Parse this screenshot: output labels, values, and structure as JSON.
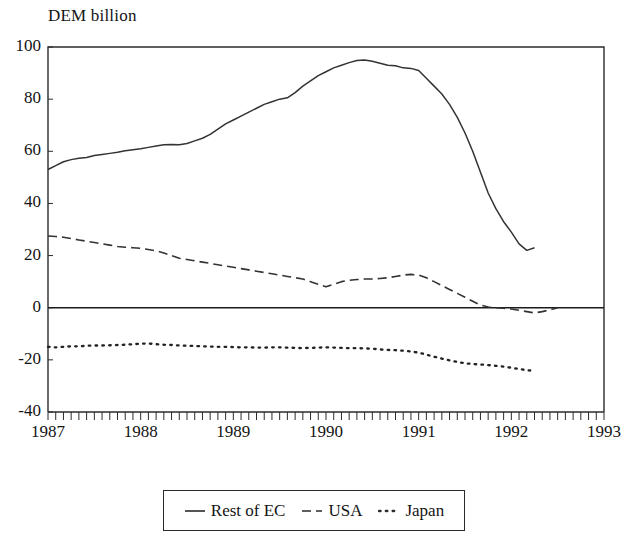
{
  "chart_data": {
    "type": "line",
    "title": "DEM billion",
    "xlabel": "",
    "ylabel": "DEM billion",
    "xlim": [
      1987.0,
      1993.0
    ],
    "ylim": [
      -40,
      100
    ],
    "ytick_labels": [
      "100",
      "80",
      "60",
      "40",
      "20",
      "0",
      "-20",
      "-40"
    ],
    "yticks": [
      100,
      80,
      60,
      40,
      20,
      0,
      -20,
      -40
    ],
    "xtick_labels": [
      "1987",
      "1988",
      "1989",
      "1990",
      "1991",
      "1992",
      "1993"
    ],
    "xticks": [
      1987,
      1988,
      1989,
      1990,
      1991,
      1992,
      1993
    ],
    "minor_xticks_per_year": 12,
    "grid": false,
    "zero_line": true,
    "legend_position": "below-center",
    "series": [
      {
        "name": "Rest of EC",
        "style": "solid",
        "color": "#333333",
        "x": [
          1987.0,
          1987.083,
          1987.167,
          1987.25,
          1987.333,
          1987.417,
          1987.5,
          1987.583,
          1987.667,
          1987.75,
          1987.833,
          1987.917,
          1988.0,
          1988.083,
          1988.167,
          1988.25,
          1988.333,
          1988.417,
          1988.5,
          1988.583,
          1988.667,
          1988.75,
          1988.833,
          1988.917,
          1989.0,
          1989.083,
          1989.167,
          1989.25,
          1989.333,
          1989.417,
          1989.5,
          1989.583,
          1989.667,
          1989.75,
          1989.833,
          1989.917,
          1990.0,
          1990.083,
          1990.167,
          1990.25,
          1990.333,
          1990.417,
          1990.5,
          1990.583,
          1990.667,
          1990.75,
          1990.833,
          1990.917,
          1991.0,
          1991.083,
          1991.167,
          1991.25,
          1991.333,
          1991.417,
          1991.5,
          1991.583,
          1991.667,
          1991.75,
          1991.833,
          1991.917,
          1992.0,
          1992.083,
          1992.167,
          1992.25
        ],
        "values": [
          53.0,
          54.5,
          56.0,
          56.8,
          57.3,
          57.6,
          58.4,
          58.8,
          59.2,
          59.6,
          60.2,
          60.6,
          61.0,
          61.5,
          62.0,
          62.5,
          62.6,
          62.5,
          63.0,
          64.0,
          65.0,
          66.5,
          68.5,
          70.5,
          72.0,
          73.5,
          75.0,
          76.5,
          78.0,
          79.0,
          80.0,
          80.5,
          82.5,
          85.0,
          87.0,
          89.0,
          90.5,
          92.0,
          93.0,
          94.0,
          94.8,
          95.0,
          94.5,
          93.8,
          93.0,
          92.8,
          92.0,
          91.8,
          91.0,
          88.0,
          85.0,
          82.0,
          78.0,
          73.0,
          67.0,
          60.0,
          52.0,
          44.0,
          38.0,
          33.0,
          29.0,
          24.5,
          22.0,
          23.0
        ]
      },
      {
        "name": "USA",
        "style": "dashed",
        "color": "#333333",
        "x": [
          1987.0,
          1987.083,
          1987.167,
          1987.25,
          1987.333,
          1987.417,
          1987.5,
          1987.583,
          1987.667,
          1987.75,
          1987.833,
          1987.917,
          1988.0,
          1988.083,
          1988.167,
          1988.25,
          1988.333,
          1988.417,
          1988.5,
          1988.583,
          1988.667,
          1988.75,
          1988.833,
          1988.917,
          1989.0,
          1989.083,
          1989.167,
          1989.25,
          1989.333,
          1989.417,
          1989.5,
          1989.583,
          1989.667,
          1989.75,
          1989.833,
          1989.917,
          1990.0,
          1990.083,
          1990.167,
          1990.25,
          1990.333,
          1990.417,
          1990.5,
          1990.583,
          1990.667,
          1990.75,
          1990.833,
          1990.917,
          1991.0,
          1991.083,
          1991.167,
          1991.25,
          1991.333,
          1991.417,
          1991.5,
          1991.583,
          1991.667,
          1991.75,
          1991.833,
          1991.917,
          1992.0,
          1992.083,
          1992.167,
          1992.25,
          1992.333,
          1992.417,
          1992.5
        ],
        "values": [
          27.5,
          27.3,
          27.0,
          26.5,
          26.0,
          25.5,
          25.0,
          24.5,
          24.0,
          23.5,
          23.2,
          23.0,
          22.8,
          22.3,
          21.8,
          21.0,
          20.0,
          19.0,
          18.5,
          18.0,
          17.5,
          17.0,
          16.5,
          16.0,
          15.5,
          15.0,
          14.5,
          14.0,
          13.5,
          13.0,
          12.5,
          12.0,
          11.5,
          11.0,
          10.0,
          9.0,
          8.0,
          9.0,
          10.0,
          10.5,
          10.8,
          11.0,
          11.0,
          11.2,
          11.5,
          12.0,
          12.5,
          12.8,
          12.5,
          11.5,
          10.0,
          8.5,
          7.0,
          5.5,
          4.0,
          2.5,
          1.0,
          0.3,
          0.0,
          -0.2,
          -0.5,
          -1.0,
          -1.5,
          -2.0,
          -1.5,
          -0.8,
          0.0
        ]
      },
      {
        "name": "Japan",
        "style": "dotted",
        "color": "#222222",
        "x": [
          1987.0,
          1987.083,
          1987.167,
          1987.25,
          1987.333,
          1987.417,
          1987.5,
          1987.583,
          1987.667,
          1987.75,
          1987.833,
          1987.917,
          1988.0,
          1988.083,
          1988.167,
          1988.25,
          1988.333,
          1988.417,
          1988.5,
          1988.583,
          1988.667,
          1988.75,
          1988.833,
          1988.917,
          1989.0,
          1989.083,
          1989.167,
          1989.25,
          1989.333,
          1989.417,
          1989.5,
          1989.583,
          1989.667,
          1989.75,
          1989.833,
          1989.917,
          1990.0,
          1990.083,
          1990.167,
          1990.25,
          1990.333,
          1990.417,
          1990.5,
          1990.583,
          1990.667,
          1990.75,
          1990.833,
          1990.917,
          1991.0,
          1991.083,
          1991.167,
          1991.25,
          1991.333,
          1991.417,
          1991.5,
          1991.583,
          1991.667,
          1991.75,
          1991.833,
          1991.917,
          1992.0,
          1992.083,
          1992.167,
          1992.25
        ],
        "values": [
          -15.0,
          -15.2,
          -15.0,
          -14.8,
          -14.8,
          -14.6,
          -14.5,
          -14.5,
          -14.4,
          -14.3,
          -14.2,
          -14.0,
          -13.8,
          -13.7,
          -14.0,
          -14.2,
          -14.3,
          -14.5,
          -14.6,
          -14.7,
          -14.8,
          -14.9,
          -15.0,
          -15.0,
          -15.1,
          -15.2,
          -15.2,
          -15.3,
          -15.3,
          -15.2,
          -15.2,
          -15.3,
          -15.4,
          -15.5,
          -15.4,
          -15.3,
          -15.2,
          -15.3,
          -15.4,
          -15.5,
          -15.5,
          -15.6,
          -15.7,
          -16.0,
          -16.2,
          -16.3,
          -16.5,
          -16.8,
          -17.2,
          -18.0,
          -18.8,
          -19.5,
          -20.2,
          -20.8,
          -21.3,
          -21.6,
          -21.8,
          -22.0,
          -22.3,
          -22.6,
          -23.0,
          -23.5,
          -24.0,
          -24.2
        ]
      }
    ]
  },
  "legend": {
    "entries": [
      {
        "label": "Rest of EC",
        "style": "solid"
      },
      {
        "label": "USA",
        "style": "dashed"
      },
      {
        "label": "Japan",
        "style": "dotted"
      }
    ]
  }
}
